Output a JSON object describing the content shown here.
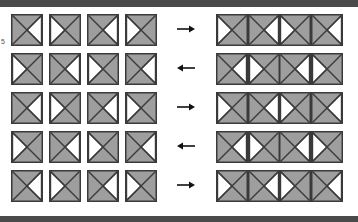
{
  "figure": {
    "edge_label": "5",
    "rules": {
      "color": "#4a4a4a"
    },
    "colors": {
      "tile_fill": "#9e9e9e",
      "tile_highlight": "#b0b0b0",
      "tile_border": "#3a3a3a",
      "white_triangle": "#ffffff",
      "arrow": "#111111",
      "rule": "#4a4a4a"
    },
    "left_panel": {
      "name": "unassembled-tiles-panel",
      "rows": 5,
      "cols": 4,
      "grid": [
        [
          "left",
          "right",
          "left",
          "right"
        ],
        [
          "right",
          "left",
          "right",
          "left"
        ],
        [
          "left",
          "right",
          "left",
          "right"
        ],
        [
          "right",
          "left",
          "right",
          "left"
        ],
        [
          "left",
          "right",
          "left",
          "right"
        ]
      ]
    },
    "right_panel": {
      "name": "assembled-tiles-panel",
      "rows": 5,
      "cols": 4,
      "grid": [
        [
          "right",
          "left",
          "right",
          "left"
        ],
        [
          "left",
          "right",
          "left",
          "right"
        ],
        [
          "right",
          "left",
          "right",
          "left"
        ],
        [
          "left",
          "right",
          "left",
          "right"
        ],
        [
          "right",
          "left",
          "right",
          "left"
        ]
      ]
    },
    "arrows": [
      {
        "label": "right-arrow",
        "direction": "right",
        "glyph": "→"
      },
      {
        "label": "left-arrow",
        "direction": "left",
        "glyph": "←"
      },
      {
        "label": "right-arrow",
        "direction": "right",
        "glyph": "→"
      },
      {
        "label": "left-arrow",
        "direction": "left",
        "glyph": "←"
      },
      {
        "label": "right-arrow",
        "direction": "right",
        "glyph": "→"
      }
    ]
  }
}
